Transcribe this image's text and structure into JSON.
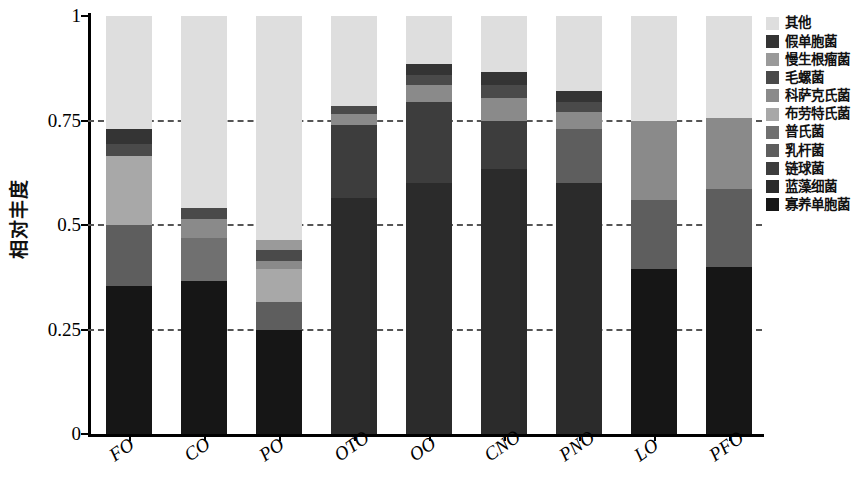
{
  "chart_data": {
    "type": "bar",
    "stacked": true,
    "title": "",
    "xlabel": "",
    "ylabel": "相对丰度",
    "ylim": [
      0,
      1
    ],
    "ytick_labels": [
      "0",
      "0.25",
      "0.5",
      "0.75",
      "1"
    ],
    "ytick_values": [
      0,
      0.25,
      0.5,
      0.75,
      1
    ],
    "grid": "horizontal-dashed",
    "legend_position": "right",
    "categories": [
      "FO",
      "CO",
      "PO",
      "OTO",
      "OO",
      "CNO",
      "PNO",
      "LO",
      "PFO"
    ],
    "series": [
      {
        "name": "寡养单胞菌",
        "color": "#161616",
        "values": [
          0.355,
          0.365,
          0.25,
          0.0,
          0.0,
          0.0,
          0.0,
          0.395,
          0.4
        ]
      },
      {
        "name": "蓝藻细菌",
        "color": "#2b2b2b",
        "values": [
          0.0,
          0.0,
          0.0,
          0.565,
          0.6,
          0.635,
          0.6,
          0.0,
          0.0
        ]
      },
      {
        "name": "链球菌",
        "color": "#3d3d3d",
        "values": [
          0.0,
          0.0,
          0.0,
          0.175,
          0.195,
          0.115,
          0.0,
          0.0,
          0.0
        ]
      },
      {
        "name": "乳杆菌",
        "color": "#5e5e5e",
        "values": [
          0.145,
          0.0,
          0.065,
          0.0,
          0.0,
          0.0,
          0.13,
          0.165,
          0.185
        ]
      },
      {
        "name": "普氏菌",
        "color": "#707070",
        "values": [
          0.0,
          0.105,
          0.0,
          0.0,
          0.0,
          0.0,
          0.0,
          0.0,
          0.0
        ]
      },
      {
        "name": "布劳特氏菌",
        "color": "#a8a8a8",
        "values": [
          0.165,
          0.0,
          0.08,
          0.0,
          0.0,
          0.0,
          0.0,
          0.0,
          0.0
        ]
      },
      {
        "name": "科萨克氏菌",
        "color": "#8a8a8a",
        "values": [
          0.0,
          0.045,
          0.02,
          0.025,
          0.04,
          0.055,
          0.04,
          0.19,
          0.17
        ]
      },
      {
        "name": "毛螺菌",
        "color": "#4a4a4a",
        "values": [
          0.03,
          0.025,
          0.025,
          0.02,
          0.025,
          0.03,
          0.025,
          0.0,
          0.0
        ]
      },
      {
        "name": "慢生根瘤菌",
        "color": "#9a9a9a",
        "values": [
          0.0,
          0.0,
          0.025,
          0.0,
          0.0,
          0.0,
          0.0,
          0.0,
          0.0
        ]
      },
      {
        "name": "假单胞菌",
        "color": "#343434",
        "values": [
          0.035,
          0.0,
          0.0,
          0.0,
          0.025,
          0.03,
          0.025,
          0.0,
          0.0
        ]
      },
      {
        "name": "其他",
        "color": "#dedede",
        "values": [
          0.27,
          0.46,
          0.535,
          0.215,
          0.115,
          0.135,
          0.18,
          0.25,
          0.245
        ]
      }
    ],
    "legend_order": [
      "其他",
      "假单胞菌",
      "慢生根瘤菌",
      "毛螺菌",
      "科萨克氏菌",
      "布劳特氏菌",
      "普氏菌",
      "乳杆菌",
      "链球菌",
      "蓝藻细菌",
      "寡养单胞菌"
    ],
    "stack_order_bottom_to_top": [
      "寡养单胞菌",
      "蓝藻细菌",
      "链球菌",
      "乳杆菌",
      "普氏菌",
      "布劳特氏菌",
      "科萨克氏菌",
      "毛螺菌",
      "慢生根瘤菌",
      "假单胞菌",
      "其他"
    ]
  }
}
